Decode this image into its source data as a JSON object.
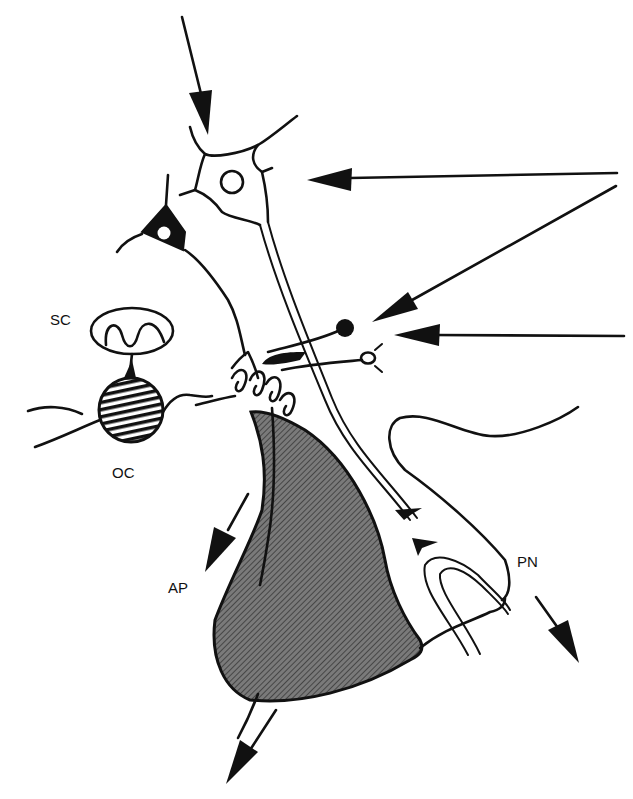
{
  "diagram": {
    "type": "neuroanatomy-schematic",
    "labels": {
      "sc": "SC",
      "oc": "OC",
      "ap": "AP",
      "pn": "PN"
    },
    "colors": {
      "ink": "#111111",
      "background": "#ffffff",
      "gland_fill": "#6e6e6e"
    },
    "elements": [
      {
        "id": "input-arrow-top",
        "desc": "arrow pointing down into multipolar neuron"
      },
      {
        "id": "input-arrow-right-upper",
        "desc": "horizontal arrow pointing left to neuron"
      },
      {
        "id": "input-arrow-right-diagonal",
        "desc": "diagonal arrow pointing to synaptic terminals"
      },
      {
        "id": "input-arrow-right-lower",
        "desc": "horizontal arrow pointing left to terminals"
      },
      {
        "id": "multipolar-neuron",
        "desc": "neuron with open nucleus, long axon descending"
      },
      {
        "id": "pyramidal-neuron",
        "desc": "dark triangular neuron with white nucleus"
      },
      {
        "id": "sc",
        "desc": "oval with oscillating waveform"
      },
      {
        "id": "oc",
        "desc": "hatched circle"
      },
      {
        "id": "ap",
        "desc": "stippled anterior lobe"
      },
      {
        "id": "pn",
        "desc": "posterior neural lobe with U-shaped vessel"
      },
      {
        "id": "output-arrow-ap",
        "desc": "arrow along anterior edge"
      },
      {
        "id": "output-arrow-bottom",
        "desc": "arrow leaving bottom of gland"
      },
      {
        "id": "output-arrow-pn",
        "desc": "arrow leaving posterior lobe"
      }
    ]
  }
}
